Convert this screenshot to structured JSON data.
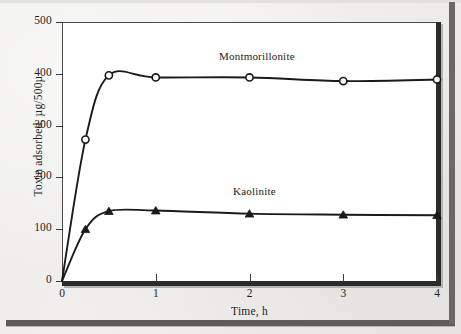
{
  "figure": {
    "kind": "scanned-textbook-figure",
    "paper_color": "#efeeec",
    "plot_background": "#ffffff",
    "axis_color": "#2b2b2a"
  },
  "chart_data": {
    "type": "line",
    "title": "",
    "xlabel": "Time, h",
    "ylabel": "Toxin adsorbed, µg/500µ",
    "xlim": [
      0,
      4
    ],
    "ylim": [
      0,
      500
    ],
    "xticks": [
      0,
      1,
      2,
      3,
      4
    ],
    "xtick_labels": [
      "0",
      "1",
      "2",
      "3",
      "4"
    ],
    "yticks": [
      0,
      100,
      200,
      300,
      400,
      500
    ],
    "ytick_labels": [
      "0",
      "100",
      "200",
      "300",
      "400",
      "500"
    ],
    "grid": false,
    "legend": "inline-annotations",
    "series": [
      {
        "name": "Montmorillonite",
        "marker": "open-circle",
        "marker_fill": "#ffffff",
        "line_color": "#1a1a19",
        "x": [
          0,
          0.25,
          0.5,
          1,
          2,
          3,
          4
        ],
        "values": [
          0,
          273,
          397,
          393,
          393,
          386,
          389
        ],
        "label_position": {
          "x": 1.67,
          "y": 437
        }
      },
      {
        "name": "Kaolinite",
        "marker": "filled-triangle",
        "marker_fill": "#1a1a19",
        "line_color": "#1a1a19",
        "x": [
          0,
          0.25,
          0.5,
          1,
          2,
          3,
          4
        ],
        "values": [
          0,
          100,
          135,
          136,
          130,
          128,
          127
        ],
        "label_position": {
          "x": 1.83,
          "y": 175
        }
      }
    ]
  },
  "annotations": {
    "montmorillonite_label": "Montmorillonite",
    "kaolinite_label": "Kaolinite"
  },
  "axis": {
    "x_title": "Time, h",
    "y_title": "Toxin adsorbed, µg/500µ"
  }
}
